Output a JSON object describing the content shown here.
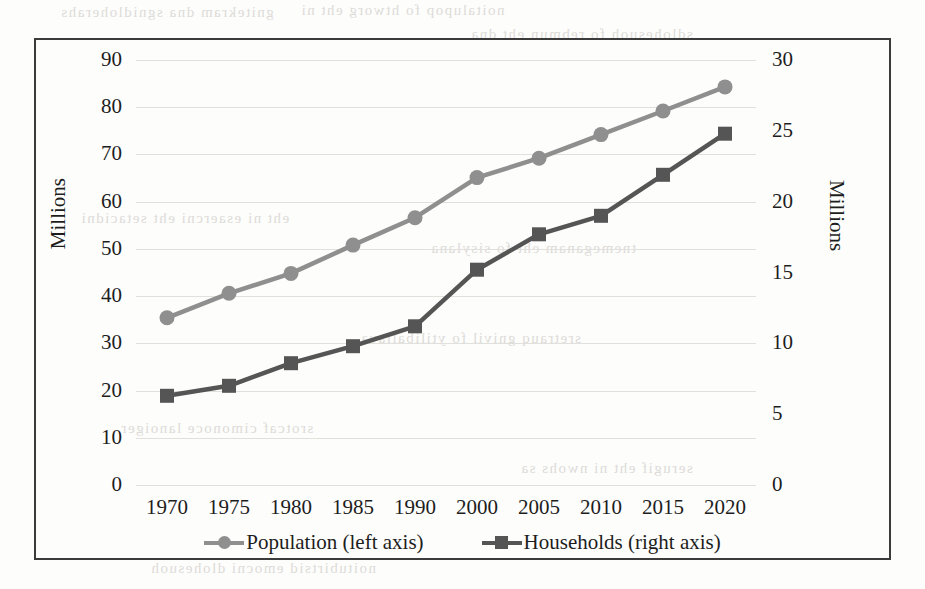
{
  "chart_data": {
    "type": "line",
    "title": "",
    "xlabel": "",
    "ylabel": "Millions",
    "y2label": "Millions",
    "categories": [
      "1970",
      "1975",
      "1980",
      "1985",
      "1990",
      "2000",
      "2005",
      "2010",
      "2015",
      "2020"
    ],
    "left_axis": {
      "label": "Millions",
      "ticks": [
        "0",
        "10",
        "20",
        "30",
        "40",
        "50",
        "60",
        "70",
        "80",
        "90"
      ],
      "tick_values": [
        0,
        10,
        20,
        30,
        40,
        50,
        60,
        70,
        80,
        90
      ],
      "min": 0,
      "max": 90
    },
    "right_axis": {
      "label": "Millions",
      "ticks": [
        "0",
        "5",
        "10",
        "15",
        "20",
        "25",
        "30"
      ],
      "tick_values": [
        0,
        5,
        10,
        15,
        20,
        25,
        30
      ],
      "min": 0,
      "max": 30
    },
    "grid": true,
    "legend_position": "bottom",
    "series": [
      {
        "name": "Population (left axis)",
        "axis": "left",
        "color": "#8f8f8f",
        "marker": "circle",
        "values": [
          35.4,
          40.6,
          44.8,
          50.8,
          56.6,
          65.1,
          69.2,
          74.2,
          79.2,
          84.3
        ]
      },
      {
        "name": "Households (right axis)",
        "axis": "right",
        "color": "#555555",
        "marker": "square",
        "values": [
          6.3,
          7.0,
          8.6,
          9.8,
          11.2,
          15.2,
          17.7,
          19.0,
          21.9,
          24.8
        ]
      }
    ]
  },
  "legend": {
    "items": [
      {
        "label": "Population (left axis)",
        "marker": "circle-marker",
        "color": "#8f8f8f"
      },
      {
        "label": "Households (right axis)",
        "marker": "square-marker",
        "color": "#555555"
      }
    ]
  },
  "colors": {
    "population": "#8f8f8f",
    "households": "#555555",
    "frame": "#3b3b3b",
    "gridline": "#e2e0dd",
    "text": "#1d1d1d",
    "page": "#fdfdfc"
  },
  "scan_artifacts": {
    "bleed_lines": [
      "gnitekram dna sgnidloherahs",
      "noitalupop fo htworg eht ni",
      "sdlohesuoh fo rebmun eht dna",
      "eht ni esaercni eht setacidni",
      "tnemeganam eht fo sisylana",
      "sretrauq gnivil fo ytilibaliava",
      "srotcaf cimonoce lanoiger",
      "serugif eht ni nwohs sa",
      "noitubirtsid emocni dlohesuoh"
    ]
  }
}
